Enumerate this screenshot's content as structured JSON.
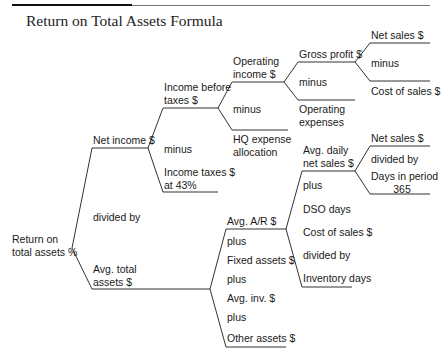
{
  "title": "Return on Total Assets Formula",
  "colors": {
    "line": "#333333",
    "text": "#1a1a1a",
    "title_rule": "#111111"
  },
  "root": {
    "label_line1": "Return on",
    "label_line2": "total assets %"
  },
  "level1": {
    "top": "Net income $",
    "operator": "divided by",
    "bottom_line1": "Avg. total",
    "bottom_line2": "assets $"
  },
  "net_income": {
    "top_line1": "Income before",
    "top_line2": "taxes $",
    "operator": "minus",
    "bottom_line1": "Income taxes $",
    "bottom_line2": "at 43%"
  },
  "income_before_taxes": {
    "top_line1": "Operating",
    "top_line2": "income $",
    "operator": "minus",
    "bottom_line1": "HQ expense",
    "bottom_line2": "allocation"
  },
  "operating_income": {
    "top": "Gross profit $",
    "operator": "minus",
    "bottom_line1": "Operating",
    "bottom_line2": "expenses"
  },
  "gross_profit": {
    "top": "Net sales $",
    "operator": "minus",
    "bottom": "Cost of sales $"
  },
  "avg_total_assets": {
    "items": [
      "Avg. A/R $",
      "plus",
      "Fixed assets $",
      "plus",
      "Avg. inv. $",
      "plus",
      "Other assets $"
    ]
  },
  "avg_ar": {
    "top_line1": "Avg. daily",
    "top_line2": "net sales $",
    "items": [
      "plus",
      "DSO days",
      "Cost of sales $",
      "divided by",
      "Inventory days"
    ]
  },
  "avg_daily_net_sales": {
    "top": "Net sales $",
    "operator": "divided by",
    "bottom_line1": "Days in period",
    "bottom_line2": "365"
  }
}
